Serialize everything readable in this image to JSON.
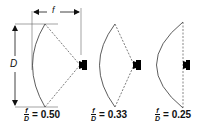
{
  "dimensions": {
    "focal_label": "f",
    "diameter_label": "D"
  },
  "reflectors": [
    {
      "ratio_numerator": "f",
      "ratio_denominator": "D",
      "equals": "= 0.50",
      "value": 0.5
    },
    {
      "ratio_numerator": "f",
      "ratio_denominator": "D",
      "equals": "= 0.33",
      "value": 0.33
    },
    {
      "ratio_numerator": "f",
      "ratio_denominator": "D",
      "equals": "= 0.25",
      "value": 0.25
    }
  ],
  "colors": {
    "line": "#333333",
    "horn": "#000000",
    "background": "#ffffff"
  }
}
